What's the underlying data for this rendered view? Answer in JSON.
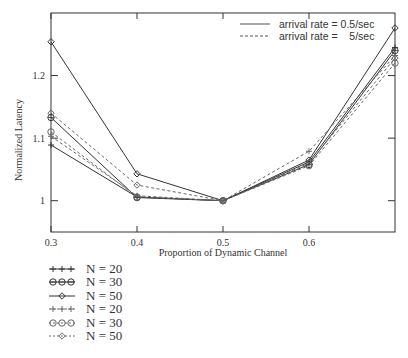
{
  "chart_data": {
    "type": "line",
    "title": "",
    "xlabel": "Proportion of Dynamic Channel",
    "ylabel": "Normalized Latency",
    "xlim": [
      0.3,
      0.7
    ],
    "ylim": [
      0.95,
      1.3
    ],
    "x_ticks": [
      "0.3",
      "0.4",
      "0.5",
      "0.6"
    ],
    "y_ticks": [
      "1",
      "1.1",
      "1.2"
    ],
    "x": [
      0.3,
      0.4,
      0.5,
      0.6,
      0.7
    ],
    "line_style_legend": [
      {
        "style": "solid",
        "label": "arrival rate = 0.5/sec"
      },
      {
        "style": "dashed",
        "label": "arrival rate =    5/sec"
      }
    ],
    "series": [
      {
        "name": "N = 20",
        "arrival_rate": "0.5/sec",
        "marker": "plus",
        "style": "solid",
        "values": [
          1.089,
          1.006,
          1.0,
          1.062,
          1.245
        ]
      },
      {
        "name": "N = 30",
        "arrival_rate": "0.5/sec",
        "marker": "circle",
        "style": "solid",
        "values": [
          1.133,
          1.005,
          1.0,
          1.058,
          1.24
        ]
      },
      {
        "name": "N = 50",
        "arrival_rate": "0.5/sec",
        "marker": "diamond",
        "style": "solid",
        "values": [
          1.254,
          1.043,
          1.0,
          1.065,
          1.276
        ]
      },
      {
        "name": "N = 20",
        "arrival_rate": "5/sec",
        "marker": "plus",
        "style": "dashed",
        "values": [
          1.103,
          1.008,
          1.0,
          1.079,
          1.232
        ]
      },
      {
        "name": "N = 30",
        "arrival_rate": "5/sec",
        "marker": "circle",
        "style": "dashed",
        "values": [
          1.11,
          1.006,
          1.0,
          1.056,
          1.22
        ]
      },
      {
        "name": "N = 50",
        "arrival_rate": "5/sec",
        "marker": "diamond",
        "style": "dashed",
        "values": [
          1.14,
          1.025,
          1.0,
          1.06,
          1.228
        ]
      }
    ],
    "legend_position": "below-left",
    "grid": false
  },
  "legend_items": [
    {
      "label": "N = 20",
      "marker": "plus",
      "style": "solid"
    },
    {
      "label": "N = 30",
      "marker": "circle",
      "style": "solid"
    },
    {
      "label": "N = 50",
      "marker": "diamond",
      "style": "solid"
    },
    {
      "label": "N = 20",
      "marker": "plus",
      "style": "dashed"
    },
    {
      "label": "N = 30",
      "marker": "circle",
      "style": "dashed"
    },
    {
      "label": "N = 50",
      "marker": "diamond",
      "style": "dashed"
    }
  ]
}
